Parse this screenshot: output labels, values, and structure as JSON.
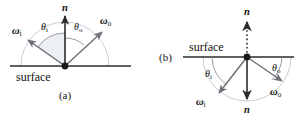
{
  "figure": {
    "title_visible": false,
    "background_color": "#ffffff",
    "ink_color": "#1a1a1a",
    "vector_color": "#5a5a5a",
    "arc_color": "#b9bdc4",
    "panels": [
      {
        "id": "a",
        "caption": "(a)",
        "caption_position": "below-center",
        "surface_label": "surface",
        "surface_label_position": "below-left-of-origin",
        "normal_label": "n",
        "normal_style": "solid-arrow-up",
        "hemisphere": "upper",
        "vectors": [
          {
            "name": "omega-i",
            "label": "ω",
            "subscript": "i",
            "direction_deg": 145,
            "style": "solid"
          },
          {
            "name": "omega-o",
            "label": "ω",
            "subscript": "o",
            "direction_deg": 48,
            "style": "solid"
          }
        ],
        "angles": [
          {
            "name": "theta-i",
            "label": "θ",
            "subscript": "i",
            "between": "n-and-omega-i"
          },
          {
            "name": "theta-o",
            "label": "θ",
            "subscript": "o",
            "between": "n-and-omega-o"
          }
        ]
      },
      {
        "id": "b",
        "caption": "(b)",
        "caption_position": "left-of-origin",
        "surface_label": "surface",
        "surface_label_position": "above-left-of-origin",
        "normal_label_top": "n",
        "normal_label_bottom": "n",
        "normal_style_top": "dotted-arrow-up",
        "normal_style_bottom": "solid-arrow-down",
        "hemisphere": "lower",
        "vectors": [
          {
            "name": "omega-i",
            "label": "ω",
            "subscript": "i",
            "direction_deg": 235,
            "style": "solid"
          },
          {
            "name": "omega-o",
            "label": "ω",
            "subscript": "o",
            "direction_deg": 327,
            "style": "solid"
          }
        ],
        "angles": [
          {
            "name": "theta-i",
            "label": "θ",
            "subscript": "i",
            "between": "surface-and-omega-i"
          },
          {
            "name": "theta-o",
            "label": "θ",
            "subscript": "o",
            "between": "surface-and-omega-o"
          }
        ]
      }
    ]
  }
}
